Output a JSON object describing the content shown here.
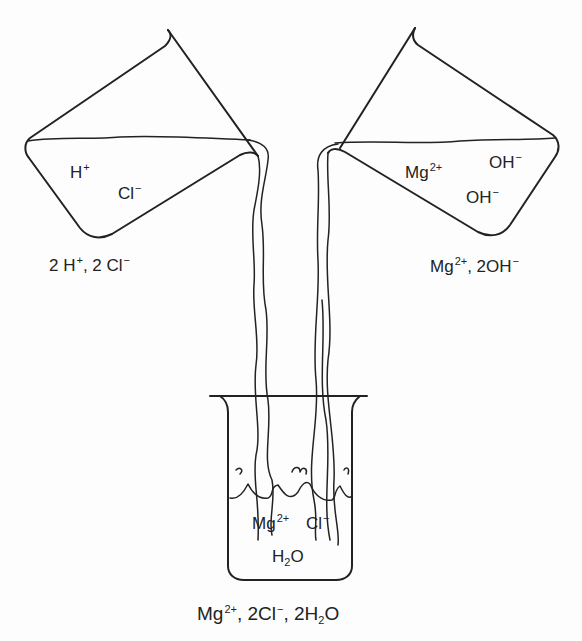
{
  "left_beaker": {
    "contents": [
      "H",
      "+",
      "Cl",
      "−"
    ],
    "ion1": {
      "base": "H",
      "sup": "+"
    },
    "ion2": {
      "base": "Cl",
      "sup": "−"
    },
    "caption": {
      "p1": "2 H",
      "s1": "+",
      "p2": ", 2 Cl",
      "s2": "−"
    }
  },
  "right_beaker": {
    "ion1": {
      "base": "Mg",
      "sup": "2+"
    },
    "ion2": {
      "base": "OH",
      "sup": "−"
    },
    "ion3": {
      "base": "OH",
      "sup": "−"
    },
    "caption": {
      "p1": "Mg",
      "s1": "2+",
      "p2": ", 2OH",
      "s2": "−"
    }
  },
  "bottom_beaker": {
    "ion1": {
      "base": "Mg",
      "sup": "2+"
    },
    "ion2": {
      "base": "Cl",
      "sup": "−"
    },
    "water": {
      "p1": "H",
      "sub": "2",
      "p2": "O"
    },
    "caption": {
      "p1": "Mg",
      "s1": "2+",
      "p2": ", 2Cl",
      "s2": "−",
      "p3": ", 2H",
      "sub": "2",
      "p4": "O"
    }
  },
  "colors": {
    "line": "#222222",
    "background": "#fdfdfd"
  }
}
